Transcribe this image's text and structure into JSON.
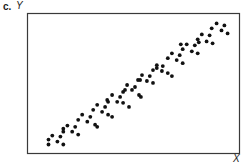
{
  "figure": {
    "panel_label": "c.",
    "y_axis_label": "Y",
    "x_axis_label": "X",
    "frame_color": "#3a3a3a",
    "dot_color": "#111111"
  },
  "chart_data": {
    "type": "scatter",
    "title": "",
    "panel": "c.",
    "xlabel": "X",
    "ylabel": "Y",
    "xlim": [
      0,
      100
    ],
    "ylim": [
      0,
      100
    ],
    "grid": false,
    "legend": null,
    "ticks": "none",
    "series": [
      {
        "name": "points",
        "points": [
          [
            9.9,
            9.9
          ],
          [
            9.9,
            6.4
          ],
          [
            11.7,
            12.8
          ],
          [
            14.1,
            8.5
          ],
          [
            15.5,
            12.1
          ],
          [
            16.9,
            6.4
          ],
          [
            16.9,
            15.6
          ],
          [
            16.9,
            17.7
          ],
          [
            18.8,
            19.9
          ],
          [
            21.1,
            15.6
          ],
          [
            22.5,
            19.1
          ],
          [
            23.9,
            13.5
          ],
          [
            23.9,
            24.1
          ],
          [
            25.8,
            27.7
          ],
          [
            28.2,
            22.7
          ],
          [
            29.6,
            26.2
          ],
          [
            31.0,
            31.2
          ],
          [
            31.9,
            20.6
          ],
          [
            32.9,
            19.1
          ],
          [
            32.9,
            34.8
          ],
          [
            35.2,
            29.8
          ],
          [
            36.6,
            33.3
          ],
          [
            37.6,
            38.3
          ],
          [
            38.0,
            27.7
          ],
          [
            39.9,
            26.2
          ],
          [
            38.0,
            36.9
          ],
          [
            39.9,
            41.8
          ],
          [
            42.3,
            36.9
          ],
          [
            43.7,
            40.4
          ],
          [
            45.1,
            44.0
          ],
          [
            45.1,
            36.2
          ],
          [
            46.0,
            45.4
          ],
          [
            47.0,
            48.9
          ],
          [
            47.9,
            33.3
          ],
          [
            49.3,
            45.4
          ],
          [
            50.7,
            47.5
          ],
          [
            52.1,
            52.5
          ],
          [
            52.6,
            41.8
          ],
          [
            53.5,
            40.4
          ],
          [
            54.0,
            56.0
          ],
          [
            53.1,
            52.5
          ],
          [
            56.3,
            51.8
          ],
          [
            57.7,
            55.3
          ],
          [
            59.2,
            59.6
          ],
          [
            59.2,
            50.4
          ],
          [
            61.0,
            63.1
          ],
          [
            61.0,
            61.0
          ],
          [
            63.4,
            58.9
          ],
          [
            63.8,
            62.4
          ],
          [
            66.2,
            68.1
          ],
          [
            66.2,
            57.4
          ],
          [
            68.1,
            71.6
          ],
          [
            68.1,
            55.3
          ],
          [
            70.4,
            66.7
          ],
          [
            71.8,
            70.2
          ],
          [
            73.2,
            74.5
          ],
          [
            73.2,
            64.5
          ],
          [
            72.3,
            78.0
          ],
          [
            75.1,
            78.0
          ],
          [
            77.5,
            73.0
          ],
          [
            78.9,
            77.3
          ],
          [
            80.3,
            81.6
          ],
          [
            80.3,
            71.6
          ],
          [
            80.8,
            79.4
          ],
          [
            82.2,
            85.1
          ],
          [
            84.5,
            80.1
          ],
          [
            85.9,
            84.4
          ],
          [
            86.9,
            89.4
          ],
          [
            87.3,
            78.7
          ],
          [
            89.2,
            92.9
          ],
          [
            91.5,
            87.9
          ],
          [
            92.9,
            91.5
          ],
          [
            94.4,
            85.8
          ]
        ]
      }
    ]
  }
}
